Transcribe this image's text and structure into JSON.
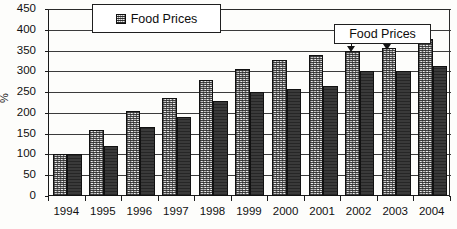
{
  "chart_data": {
    "type": "bar",
    "title": "",
    "xlabel": "",
    "ylabel": "%",
    "ylim": [
      0,
      450
    ],
    "ytick_step": 50,
    "yticks": [
      450,
      400,
      350,
      300,
      250,
      200,
      150,
      100,
      50,
      0
    ],
    "grid": true,
    "legend_position": "top-left-inside",
    "categories": [
      "1994",
      "1995",
      "1996",
      "1997",
      "1998",
      "1999",
      "2000",
      "2001",
      "2002",
      "2003",
      "2004"
    ],
    "series": [
      {
        "name": "Food Prices",
        "style": "light-speckled",
        "values": [
          100,
          160,
          205,
          235,
          280,
          305,
          327,
          340,
          350,
          355,
          378
        ]
      },
      {
        "name": "Series 2",
        "style": "dark-solid",
        "values": [
          100,
          120,
          165,
          190,
          228,
          250,
          258,
          265,
          300,
          300,
          313
        ]
      }
    ],
    "annotations": [
      {
        "text": "Food Prices",
        "kind": "callout-box-with-arrows",
        "points_to": [
          "2002 light bar",
          "2003 light bar"
        ]
      }
    ]
  },
  "legend": {
    "label": "Food Prices",
    "swatch": "speckled-square"
  },
  "callout": {
    "label": "Food Prices"
  },
  "axis": {
    "y_title": "%"
  },
  "colors": {
    "series_light": "#bdbdbd",
    "series_dark": "#3a3a3a",
    "axis": "#1a1a1a",
    "grid": "#3b3b3b",
    "background": "#fdfdfb",
    "text": "#111111"
  }
}
